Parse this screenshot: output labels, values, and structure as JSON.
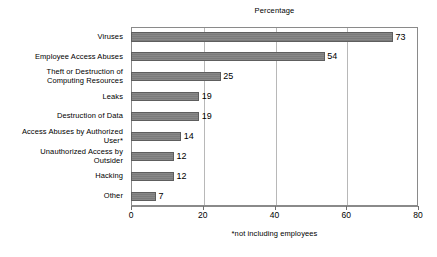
{
  "chart_data": {
    "type": "bar",
    "orientation": "horizontal",
    "title": "Percentage",
    "xlabel": "",
    "ylabel": "",
    "xlim": [
      0,
      80
    ],
    "xticks": [
      0,
      20,
      40,
      60,
      80
    ],
    "grid": "vertical",
    "legend": "none",
    "footnote": "*not including employees",
    "bar_color": "#808080",
    "frame_color": "#8a8a8a",
    "gridline_color": "#b8b8b8",
    "categories": [
      "Viruses",
      "Employee Access Abuses",
      "Theft or Destruction of Computing Resources",
      "Leaks",
      "Destruction of Data",
      "Access Abuses by Authorized User*",
      "Unauthorized Access by Outsider",
      "Hacking",
      "Other"
    ],
    "values": [
      73,
      54,
      25,
      19,
      19,
      14,
      12,
      12,
      7
    ],
    "data_labels": [
      "73",
      "54",
      "25",
      "19",
      "19",
      "14",
      "12",
      "12",
      "7"
    ],
    "category_label_lines": [
      [
        "Viruses"
      ],
      [
        "Employee Access Abuses"
      ],
      [
        "Theft or Destruction of",
        "Computing Resources"
      ],
      [
        "Leaks"
      ],
      [
        "Destruction of Data"
      ],
      [
        "Access Abuses by Authorized",
        "User*"
      ],
      [
        "Unauthorized Access by",
        "Outsider"
      ],
      [
        "Hacking"
      ],
      [
        "Other"
      ]
    ],
    "xtick_labels": [
      "0",
      "20",
      "40",
      "60",
      "80"
    ]
  }
}
